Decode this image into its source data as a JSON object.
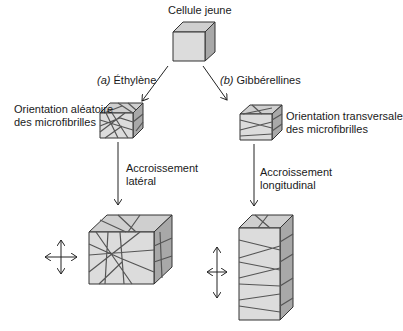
{
  "diagram": {
    "title_node": "Cellule jeune",
    "branches": [
      {
        "id": "a",
        "prefix": "(a)",
        "hormone": "Éthylène",
        "orientation_line1": "Orientation aléatoire",
        "orientation_line2": "des microfibrilles",
        "growth_line1": "Accroissement",
        "growth_line2": "latéral"
      },
      {
        "id": "b",
        "prefix": "(b)",
        "hormone": "Gibbérellines",
        "orientation_line1": "Orientation transversale",
        "orientation_line2": "des microfibrilles",
        "growth_line1": "Accroissement",
        "growth_line2": "longitudinal"
      }
    ],
    "icons": {
      "growth_direction_left": "four-way-arrow-icon",
      "growth_direction_right": "four-way-arrow-icon"
    },
    "colors": {
      "front_face": "#dcdcdc",
      "top_face": "#cfcfcf",
      "side_face": "#a8a8a8",
      "fibril": "#555555",
      "outline": "#333333"
    }
  }
}
